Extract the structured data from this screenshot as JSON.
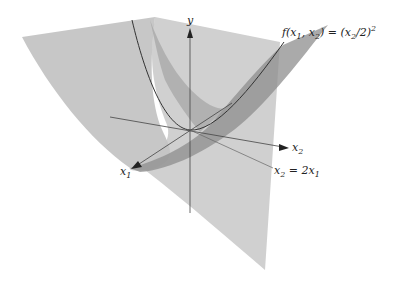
{
  "diagram": {
    "axes": {
      "y_label": "y",
      "x1_label": "x",
      "x1_sub": "1",
      "x2_label": "x",
      "x2_sub": "2"
    },
    "function_label": {
      "prefix": "f(x",
      "sub1": "1",
      "mid": ", x",
      "sub2": "2",
      "eq": ") = (x",
      "sub3": "2",
      "tail": "/2)",
      "sup": "2"
    },
    "plane_label": {
      "lhs": "x",
      "lhs_sub": "2",
      "eq": " = 2x",
      "rhs_sub": "1"
    },
    "colors": {
      "surface": "#9a9a9a",
      "plane": "#b5b5b5",
      "curve": "#333333",
      "axis": "#444444"
    }
  }
}
